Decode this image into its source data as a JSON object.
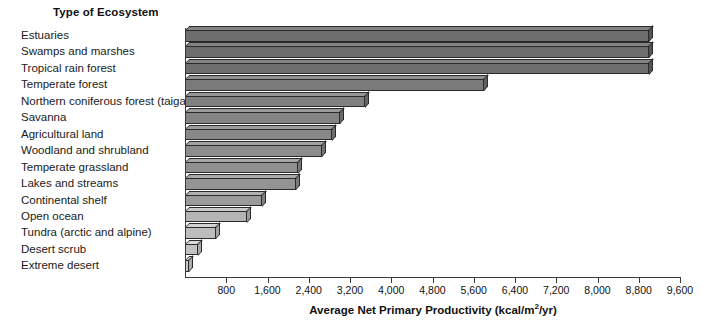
{
  "chart_data": {
    "type": "bar",
    "orientation": "horizontal",
    "title": "Type of Ecosystem",
    "xlabel": "Average Net Primary Productivity (kcal/m²/yr)",
    "ylabel": "Type of Ecosystem",
    "xlim": [
      0,
      9600
    ],
    "grid": false,
    "legend": "none",
    "tick_labels": [
      "800",
      "1,600",
      "2,400",
      "3,200",
      "4,000",
      "4,800",
      "5,600",
      "6,400",
      "7,200",
      "8,000",
      "8,800",
      "9,600"
    ],
    "tick_values": [
      800,
      1600,
      2400,
      3200,
      4000,
      4800,
      5600,
      6400,
      7200,
      8000,
      8800,
      9600
    ],
    "categories": [
      "Estuaries",
      "Swamps and marshes",
      "Tropical rain forest",
      "Temperate forest",
      "Northern coniferous forest (taiga)",
      "Savanna",
      "Agricultural land",
      "Woodland and shrubland",
      "Temperate grassland",
      "Lakes and streams",
      "Continental shelf",
      "Open ocean",
      "Tundra (arctic and alpine)",
      "Desert scrub",
      "Extreme desert"
    ],
    "values": [
      9000,
      9000,
      9000,
      5800,
      3500,
      3000,
      2850,
      2650,
      2200,
      2150,
      1500,
      1200,
      600,
      250,
      70
    ],
    "bar_colors": [
      "#6e6e6e",
      "#6e6e6e",
      "#6e6e6e",
      "#7a7a7a",
      "#808080",
      "#848484",
      "#888888",
      "#8c8c8c",
      "#909090",
      "#949494",
      "#9a9a9a",
      "#b4b4b4",
      "#bdbdbd",
      "#c2c2c2",
      "#c6c6c6"
    ]
  },
  "axis_title_parts": {
    "main": "Average Net Primary Productivity (kcal/m",
    "sup": "2",
    "tail": "/yr)"
  }
}
